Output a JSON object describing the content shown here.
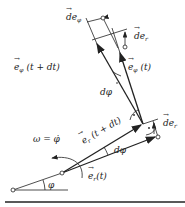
{
  "labels": {
    "de_phi": "de",
    "de_phi_sub": "φ",
    "de_r_top": "de",
    "de_r_top_sub": "r",
    "e_phi_t_dt": "e",
    "e_phi_t_dt_sub": "φ",
    "e_phi_t_dt_arg": "(t + dt)",
    "e_phi_t": "e",
    "e_phi_t_sub": "φ",
    "e_phi_t_arg": "(t)",
    "dphi_upper": "dφ",
    "omega": "ω = φ̇",
    "e_r_t_dt": "e",
    "e_r_t_dt_sub": "r",
    "e_r_t_dt_arg": "(t + dt)",
    "dphi_lower": "dφ",
    "de_r_right": "de",
    "de_r_right_sub": "r",
    "e_r_t": "e",
    "e_r_t_sub": "r",
    "e_r_t_arg": "(t)",
    "phi": "φ"
  },
  "colors": {
    "stroke": "#222222",
    "background": "#ffffff"
  }
}
